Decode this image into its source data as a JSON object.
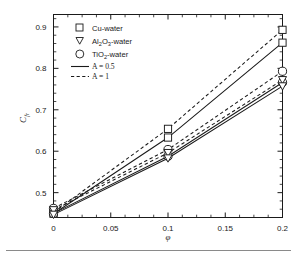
{
  "chart_data": {
    "type": "line",
    "title": "",
    "xlabel": "φ",
    "ylabel": "C",
    "ylabel_sub": "fr",
    "xlim": [
      0,
      0.2
    ],
    "ylim": [
      0.44,
      0.93
    ],
    "xticks": [
      0,
      0.05,
      0.1,
      0.15,
      0.2
    ],
    "xticklabels": [
      "0",
      "0.05",
      "0.1",
      "0.15",
      "0.2"
    ],
    "yticks": [
      0.5,
      0.6,
      0.7,
      0.8,
      0.9
    ],
    "yticklabels": [
      "0.5",
      "0.6",
      "0.7",
      "0.8",
      "0.9"
    ],
    "minor_ticks": true,
    "grid": false,
    "legend_position": "upper-left",
    "x": [
      0,
      0.1,
      0.2
    ],
    "series": [
      {
        "name": "Cu-water, A = 1",
        "fluid": "Cu-water",
        "A": 1,
        "marker": "square",
        "linestyle": "dashed",
        "values": [
          0.452,
          0.654,
          0.893
        ]
      },
      {
        "name": "Cu-water, A = 0.5",
        "fluid": "Cu-water",
        "A": 0.5,
        "marker": "square",
        "linestyle": "solid",
        "values": [
          0.449,
          0.633,
          0.862
        ]
      },
      {
        "name": "TiO2-water, A = 1",
        "fluid": "TiO2-water",
        "A": 1,
        "marker": "circle",
        "linestyle": "dashed",
        "values": [
          0.462,
          0.604,
          0.793
        ]
      },
      {
        "name": "TiO2-water, A = 0.5",
        "fluid": "TiO2-water",
        "A": 0.5,
        "marker": "circle",
        "linestyle": "solid",
        "values": [
          0.45,
          0.588,
          0.766
        ]
      },
      {
        "name": "Al2O3-water, A = 1",
        "fluid": "Al2O3-water",
        "A": 1,
        "marker": "triangle",
        "linestyle": "dashed",
        "values": [
          0.458,
          0.596,
          0.772
        ]
      },
      {
        "name": "Al2O3-water, A = 0.5",
        "fluid": "Al2O3-water",
        "A": 0.5,
        "marker": "triangle",
        "linestyle": "solid",
        "values": [
          0.447,
          0.583,
          0.757
        ]
      }
    ]
  },
  "legend": {
    "entries": [
      {
        "symbol": "square",
        "label": "Cu-water",
        "sub": "",
        "tail": ""
      },
      {
        "symbol": "triangle",
        "label": "Al",
        "sub": "2",
        "mid": "O",
        "sub2": "3",
        "tail": "-water"
      },
      {
        "symbol": "circle",
        "label": "TiO",
        "sub": "2",
        "tail": "-water"
      },
      {
        "symbol": "solid-line",
        "label": "A = 0.5"
      },
      {
        "symbol": "dashed-line",
        "label": "A = 1"
      }
    ],
    "cu_label": "Cu-water",
    "al_prefix": "Al",
    "al_sub1": "2",
    "al_mid": "O",
    "al_sub2": "3",
    "al_tail": "-water",
    "tio_prefix": "TiO",
    "tio_sub": "2",
    "tio_tail": "-water",
    "a_half": "A = 0.5",
    "a_one": "A = 1"
  },
  "colors": {
    "line": "#1a1a1a",
    "marker_fill": "#ffffff",
    "frame": "#1a1a1a",
    "background": "#ffffff",
    "rule": "#8a8a8a"
  }
}
